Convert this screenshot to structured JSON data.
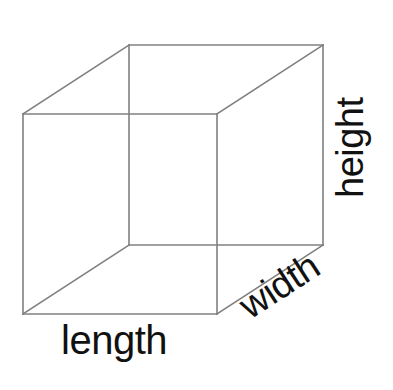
{
  "figure": {
    "shape": "rectangular-prism",
    "stroke_color": "#808080",
    "label_color": "#111111",
    "background_color": "#ffffff",
    "stroke_width": 1.6
  },
  "labels": {
    "length": "length",
    "width": "width",
    "height": "height"
  },
  "geometry": {
    "front_face": {
      "top_left": [
        23,
        114
      ],
      "top_right": [
        217,
        114
      ],
      "bottom_right": [
        217,
        314
      ],
      "bottom_left": [
        23,
        314
      ]
    },
    "back_face": {
      "top_left": [
        129,
        45
      ],
      "top_right": [
        323,
        45
      ],
      "bottom_right": [
        323,
        245
      ],
      "bottom_left": [
        129,
        245
      ]
    },
    "depth_offset": [
      106,
      -69
    ]
  }
}
